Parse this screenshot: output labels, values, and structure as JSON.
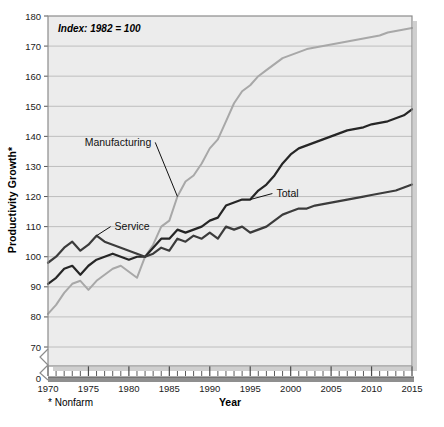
{
  "figure": {
    "annotation": "Index: 1982 = 100",
    "footnote": "* Nonfarm",
    "ylabel": "Productivity Growth*",
    "xlabel": "Year",
    "plot_bg": "#ececec",
    "frame_color": "#8c8c8c",
    "grid_color": "#b9b9b9"
  },
  "chart_data": {
    "type": "line",
    "title": "",
    "subtitle": "Index: 1982 = 100",
    "xlabel": "Year",
    "ylabel": "Productivity Growth*",
    "xlim": [
      1970,
      2015
    ],
    "ylim": [
      70,
      180
    ],
    "y_axis_break_to_zero": true,
    "grid": "horizontal",
    "legend": "inline-labels",
    "ytick_labels": [
      "0",
      "70",
      "80",
      "90",
      "100",
      "110",
      "120",
      "130",
      "140",
      "150",
      "160",
      "170",
      "180"
    ],
    "xtick_labels": [
      "1970",
      "1975",
      "1980",
      "1985",
      "1990",
      "1995",
      "2000",
      "2005",
      "2010",
      "2015"
    ],
    "xtick_minor_step": 1,
    "x": [
      1970,
      1971,
      1972,
      1973,
      1974,
      1975,
      1976,
      1977,
      1978,
      1979,
      1980,
      1981,
      1982,
      1983,
      1984,
      1985,
      1986,
      1987,
      1988,
      1989,
      1990,
      1991,
      1992,
      1993,
      1994,
      1995,
      1996,
      1997,
      1998,
      1999,
      2000,
      2001,
      2002,
      2003,
      2004,
      2005,
      2006,
      2007,
      2008,
      2009,
      2010,
      2011,
      2012,
      2013,
      2014,
      2015
    ],
    "series": [
      {
        "name": "Manufacturing",
        "color": "#a8a8a8",
        "label_x": 1984,
        "label_y": 138,
        "values": [
          81,
          84,
          88,
          91,
          92,
          89,
          92,
          94,
          96,
          97,
          95,
          93,
          100,
          104,
          110,
          112,
          120,
          125,
          127,
          131,
          136,
          139,
          145,
          151,
          155,
          157,
          160,
          162,
          164,
          166,
          167,
          168,
          169,
          169.5,
          170,
          170.5,
          171,
          171.5,
          172,
          172.5,
          173,
          173.5,
          174.5,
          175,
          175.5,
          176
        ]
      },
      {
        "name": "Total",
        "color": "#262626",
        "label_x": 1997,
        "label_y": 121,
        "values": [
          91,
          93,
          96,
          97,
          94,
          97,
          99,
          100,
          101,
          100,
          99,
          100,
          100,
          103,
          106,
          106,
          109,
          108,
          109,
          110,
          112,
          113,
          117,
          118,
          119,
          119,
          122,
          124,
          127,
          131,
          134,
          136,
          137,
          138,
          139,
          140,
          141,
          142,
          142.5,
          143,
          144,
          144.5,
          145,
          146,
          147,
          149
        ]
      },
      {
        "name": "Service",
        "color": "#3c3c3c",
        "label_x": 1977,
        "label_y": 110,
        "values": [
          98,
          100,
          103,
          105,
          102,
          104,
          107,
          105,
          104,
          103,
          102,
          101,
          100,
          101,
          103,
          102,
          106,
          105,
          107,
          106,
          108,
          106,
          110,
          109,
          110,
          108,
          109,
          110,
          112,
          114,
          115,
          116,
          116,
          117,
          117.5,
          118,
          118.5,
          119,
          119.5,
          120,
          120.5,
          121,
          121.5,
          122,
          123,
          124
        ]
      }
    ]
  }
}
